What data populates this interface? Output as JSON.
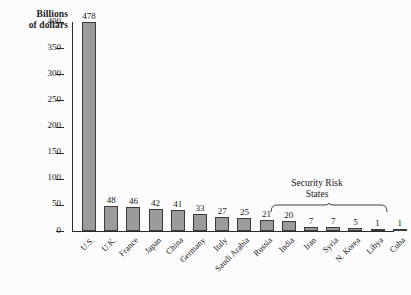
{
  "chart_data": {
    "type": "bar",
    "title": "",
    "ylabel": "Billions of dollars",
    "xlabel": "",
    "ylim": [
      0,
      400
    ],
    "ytick_step": 50,
    "grid": false,
    "legend": false,
    "bar_color": "#9b9b9b",
    "bar_edge_color": "#3a3a3a",
    "background_color": "#fcfcfc",
    "text_color": "#1a1a1a",
    "yticks": [
      "0",
      "50",
      "100",
      "150",
      "200",
      "250",
      "300",
      "350",
      "400"
    ],
    "ytick_values": [
      0,
      50,
      100,
      150,
      200,
      250,
      300,
      350,
      400
    ],
    "categories": [
      "U.S.",
      "U.K.",
      "France",
      "Japan",
      "China",
      "Germany",
      "Italy",
      "Saudi Arabia",
      "Russia",
      "India",
      "Iran",
      "Syria",
      "N. Korea",
      "Libya",
      "Cuba"
    ],
    "values": [
      478,
      48,
      46,
      42,
      41,
      33,
      27,
      25,
      21,
      20,
      7,
      7,
      5,
      1,
      1
    ],
    "value_labels": [
      "478",
      "48",
      "46",
      "42",
      "41",
      "33",
      "27",
      "25",
      "21",
      "20",
      "7",
      "7",
      "5",
      "1",
      "1"
    ],
    "annotations": [
      {
        "text_line1": "Security Risk",
        "text_line2": "States",
        "covers": [
          "Iran",
          "Syria",
          "N. Korea",
          "Libya",
          "Cuba"
        ],
        "marker": "brace"
      }
    ]
  },
  "axis_title": {
    "line1": "Billions",
    "line2": "of dollars"
  },
  "annotation": {
    "line1": "Security Risk",
    "line2": "States"
  }
}
